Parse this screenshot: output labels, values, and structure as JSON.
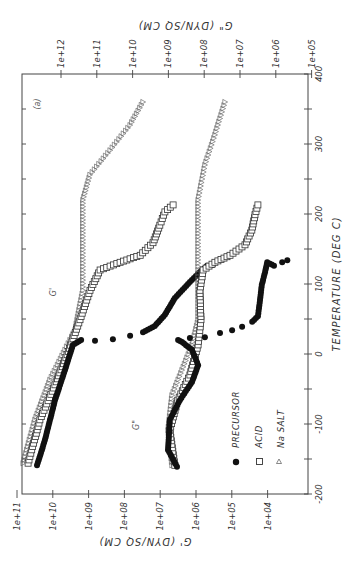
{
  "chart_data": {
    "type": "scatter",
    "orientation": "rotated 90deg counter-clockwise (temperature axis runs vertically on the right)",
    "panel_label": "(a)",
    "xlabel": "TEMPERATURE   (DEG  C)",
    "ylabel_left": "G'  (DYN/SQ CM)",
    "ylabel_right": "G\"  (DYN/SQ CM)",
    "xlim": [
      -200,
      400
    ],
    "x_ticks": [
      "-200",
      "-100",
      "0",
      "100",
      "200",
      "300",
      "400"
    ],
    "y_left_scale": "log",
    "y_left_ticks": [
      "1e+11",
      "1e+10",
      "1e+09",
      "1e+08",
      "1e+07",
      "1e+06",
      "1e+05",
      "1e+04"
    ],
    "y_left_lim_log10": [
      4,
      11
    ],
    "y_right_scale": "log",
    "y_right_ticks": [
      "1e+12",
      "1e+11",
      "1e+10",
      "1e+09",
      "1e+08",
      "1e+07",
      "1e+06",
      "1e+05"
    ],
    "y_right_lim_log10": [
      5,
      12
    ],
    "annotations": [
      {
        "text": "G'",
        "near": "upper curve group"
      },
      {
        "text": "G\"",
        "near": "lower curve group"
      }
    ],
    "legend": [
      {
        "marker": "filled-circle",
        "label": "PRECURSOR"
      },
      {
        "marker": "open-square",
        "label": "ACID"
      },
      {
        "marker": "open-triangle",
        "label": "Na SALT"
      }
    ],
    "series": [
      {
        "name": "Na SALT G'",
        "modulus": "G'",
        "axis": "left",
        "marker": "triangle",
        "points": [
          [
            -156,
            10.83
          ],
          [
            -94,
            10.5
          ],
          [
            -37,
            10.08
          ],
          [
            6,
            9.66
          ],
          [
            34,
            9.38
          ],
          [
            91,
            9.16
          ],
          [
            149,
            9.16
          ],
          [
            220,
            9.16
          ],
          [
            256,
            8.96
          ],
          [
            291,
            8.4
          ],
          [
            327,
            7.84
          ],
          [
            360,
            7.48
          ]
        ]
      },
      {
        "name": "ACID G'",
        "modulus": "G'",
        "axis": "left",
        "marker": "square",
        "points": [
          [
            -156,
            10.69
          ],
          [
            -94,
            10.36
          ],
          [
            -44,
            9.94
          ],
          [
            -1,
            9.6
          ],
          [
            49,
            9.24
          ],
          [
            91,
            8.96
          ],
          [
            120,
            8.68
          ],
          [
            131,
            8.12
          ],
          [
            141,
            7.56
          ],
          [
            159,
            7.2
          ],
          [
            184,
            7.01
          ],
          [
            203,
            6.87
          ],
          [
            213,
            6.64
          ]
        ]
      },
      {
        "name": "PRECURSOR G'",
        "modulus": "G'",
        "axis": "left",
        "marker": "circle",
        "points": [
          [
            -159,
            10.44
          ],
          [
            -123,
            10.22
          ],
          [
            -66,
            9.94
          ],
          [
            -23,
            9.66
          ],
          [
            13,
            9.44
          ],
          [
            20,
            9.21
          ],
          [
            19,
            8.82
          ],
          [
            21,
            8.32
          ],
          [
            26,
            7.84
          ],
          [
            31,
            7.48
          ],
          [
            40,
            7.15
          ],
          [
            56,
            6.87
          ],
          [
            80,
            6.59
          ],
          [
            103,
            6.17
          ],
          [
            117,
            5.89
          ],
          [
            126,
            5.69
          ],
          [
            127,
            5.53
          ]
        ]
      },
      {
        "name": "Na SALT G\"",
        "modulus": "G\"",
        "axis": "right",
        "marker": "triangle",
        "points": [
          [
            -159,
            8.9
          ],
          [
            -109,
            9.01
          ],
          [
            -59,
            8.9
          ],
          [
            -23,
            8.62
          ],
          [
            13,
            8.34
          ],
          [
            49,
            8.17
          ],
          [
            106,
            8.17
          ],
          [
            177,
            8.17
          ],
          [
            220,
            8.17
          ],
          [
            270,
            7.98
          ],
          [
            313,
            7.7
          ],
          [
            360,
            7.42
          ]
        ]
      },
      {
        "name": "ACID G\"",
        "modulus": "G\"",
        "axis": "right",
        "marker": "square",
        "points": [
          [
            -159,
            8.82
          ],
          [
            -109,
            8.96
          ],
          [
            -66,
            8.74
          ],
          [
            -30,
            8.4
          ],
          [
            13,
            8.17
          ],
          [
            49,
            8.09
          ],
          [
            91,
            8.12
          ],
          [
            120,
            8.03
          ],
          [
            131,
            7.7
          ],
          [
            141,
            7.28
          ],
          [
            156,
            6.86
          ],
          [
            177,
            6.67
          ],
          [
            199,
            6.58
          ],
          [
            213,
            6.5
          ]
        ]
      },
      {
        "name": "PRECURSOR G\"",
        "modulus": "G\"",
        "axis": "right",
        "marker": "circle",
        "points": [
          [
            -161,
            8.76
          ],
          [
            -137,
            9.01
          ],
          [
            -94,
            8.96
          ],
          [
            -66,
            8.68
          ],
          [
            -40,
            8.34
          ],
          [
            -16,
            8.17
          ],
          [
            6,
            8.34
          ],
          [
            17,
            8.62
          ],
          [
            20,
            8.73
          ],
          [
            23,
            8.4
          ],
          [
            24,
            7.98
          ],
          [
            30,
            7.56
          ],
          [
            34,
            7.22
          ],
          [
            39,
            6.94
          ],
          [
            46,
            6.66
          ],
          [
            54,
            6.5
          ],
          [
            77,
            6.44
          ],
          [
            99,
            6.39
          ],
          [
            117,
            6.3
          ],
          [
            131,
            6.24
          ],
          [
            126,
            6.05
          ],
          [
            131,
            5.82
          ],
          [
            134,
            5.68
          ]
        ]
      }
    ]
  }
}
